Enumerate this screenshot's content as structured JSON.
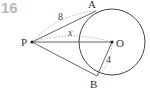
{
  "problem": {
    "number": "16"
  },
  "diagram": {
    "points": {
      "P": {
        "label": "P",
        "x": 32,
        "y": 42
      },
      "O": {
        "label": "O",
        "x": 112,
        "y": 42
      },
      "A": {
        "label": "A",
        "x": 96,
        "y": 11
      },
      "B": {
        "label": "B",
        "x": 97,
        "y": 76
      }
    },
    "circle": {
      "center": "O",
      "radius": 33
    },
    "segments": [
      {
        "from": "P",
        "to": "A",
        "type": "tangent"
      },
      {
        "from": "P",
        "to": "B",
        "type": "tangent"
      },
      {
        "from": "P",
        "to": "O",
        "type": "line"
      },
      {
        "from": "O",
        "to": "B",
        "type": "radius"
      }
    ],
    "labels": {
      "PA": "8",
      "PO": "x",
      "OB": "4"
    },
    "colors": {
      "line": "#555555",
      "dashed": "#999999",
      "problem_number": "#b8b8b8"
    }
  }
}
